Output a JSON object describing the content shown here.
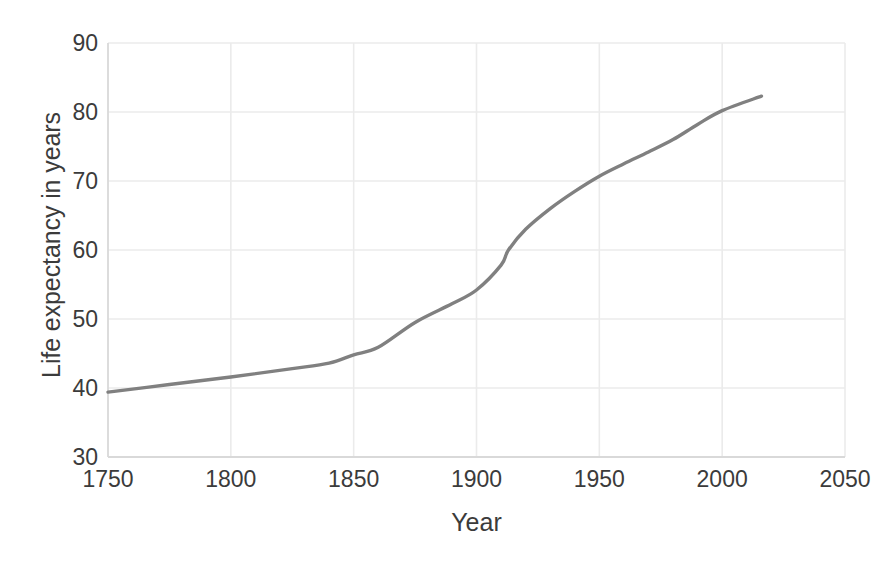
{
  "chart_data": {
    "type": "line",
    "title": "",
    "xlabel": "Year",
    "ylabel": "Life expectancy in years",
    "xlim": [
      1750,
      2050
    ],
    "ylim": [
      30,
      90
    ],
    "xticks": [
      1750,
      1800,
      1850,
      1900,
      1950,
      2000,
      2050
    ],
    "yticks": [
      30,
      40,
      50,
      60,
      70,
      80,
      90
    ],
    "grid": true,
    "legend": "none",
    "series": [
      {
        "name": "Life expectancy",
        "color": "#808080",
        "x": [
          1750,
          1775,
          1800,
          1825,
          1840,
          1850,
          1860,
          1875,
          1890,
          1900,
          1910,
          1913,
          1920,
          1930,
          1940,
          1950,
          1960,
          1970,
          1980,
          1990,
          2000,
          2016
        ],
        "values": [
          39.4,
          40.5,
          41.6,
          42.8,
          43.6,
          44.8,
          45.9,
          49.5,
          52.2,
          54.2,
          57.8,
          60.0,
          63.0,
          66.0,
          68.5,
          70.7,
          72.5,
          74.2,
          76.0,
          78.2,
          80.2,
          82.3
        ]
      }
    ]
  },
  "axis": {
    "y_title": "Life expectancy in years",
    "x_title": "Year"
  },
  "colors": {
    "line": "#808080",
    "grid": "#ebebeb",
    "axis": "#d9d9d9",
    "text": "#3b3b3b",
    "background": "#ffffff"
  }
}
